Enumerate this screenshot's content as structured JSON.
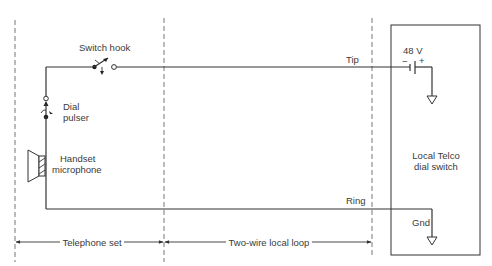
{
  "diagram": {
    "type": "telephone-local-loop-circuit",
    "labels": {
      "switch_hook": "Switch hook",
      "dial": "Dial",
      "pulser": "pulser",
      "handset": "Handset",
      "microphone": "microphone",
      "tip": "Tip",
      "ring": "Ring",
      "battery_voltage": "48 V",
      "battery_minus": "−",
      "battery_plus": "+",
      "telco_line1": "Local Telco",
      "telco_line2": "dial switch",
      "gnd": "Gnd"
    },
    "spans": [
      {
        "label": "Telephone set"
      },
      {
        "label": "Two-wire local loop"
      }
    ],
    "nodes": [
      "switch-hook",
      "dial-pulser",
      "handset-microphone",
      "battery-48v",
      "local-telco-dial-switch",
      "ground"
    ],
    "edges": [
      {
        "from": "switch-hook",
        "to": "battery-48v",
        "label": "Tip"
      },
      {
        "from": "handset-microphone",
        "to": "ground",
        "label": "Ring"
      }
    ]
  }
}
